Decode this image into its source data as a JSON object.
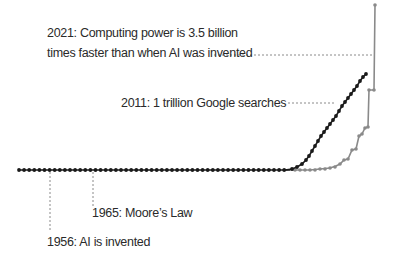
{
  "chart_data": {
    "type": "line",
    "title": "",
    "xlabel": "",
    "ylabel": "",
    "grid": false,
    "legend": "none",
    "series": [
      {
        "name": "Computing power",
        "color": "#8a8a8a",
        "description": "Flat from 1956 until ~2000s, then steps sharply upward to 3.5 billion times by 2021"
      },
      {
        "name": "Google searches",
        "color": "#1a1a1a",
        "description": "Flat until ~2000, then rises steeply reaching 1 trillion by 2011"
      },
      {
        "name": "Baseline (1956 onward)",
        "color": "#1a1a1a",
        "description": "Dotted flat line of data points"
      }
    ],
    "annotations": [
      {
        "id": "a2021",
        "year": 2021,
        "lines": [
          "2021: Computing power is 3.5 billion",
          "times faster than when AI was invented"
        ]
      },
      {
        "id": "a2011",
        "year": 2011,
        "lines": [
          "2011: 1 trillion Google searches"
        ]
      },
      {
        "id": "a1965",
        "year": 1965,
        "lines": [
          "1965: Moore’s Law"
        ]
      },
      {
        "id": "a1956",
        "year": 1956,
        "lines": [
          "1956: AI is invented"
        ]
      }
    ]
  },
  "labels": {
    "a2021_line1": "2021: Computing power is 3.5 billion",
    "a2021_line2": "times faster than when AI was invented",
    "a2011": "2011: 1 trillion Google searches",
    "a1965": "1965: Moore’s Law",
    "a1956": "1956: AI is invented"
  },
  "colors": {
    "black_series": "#1a1a1a",
    "gray_series": "#8a8a8a",
    "leader": "#8a8a8a",
    "text": "#2a2a2a"
  }
}
